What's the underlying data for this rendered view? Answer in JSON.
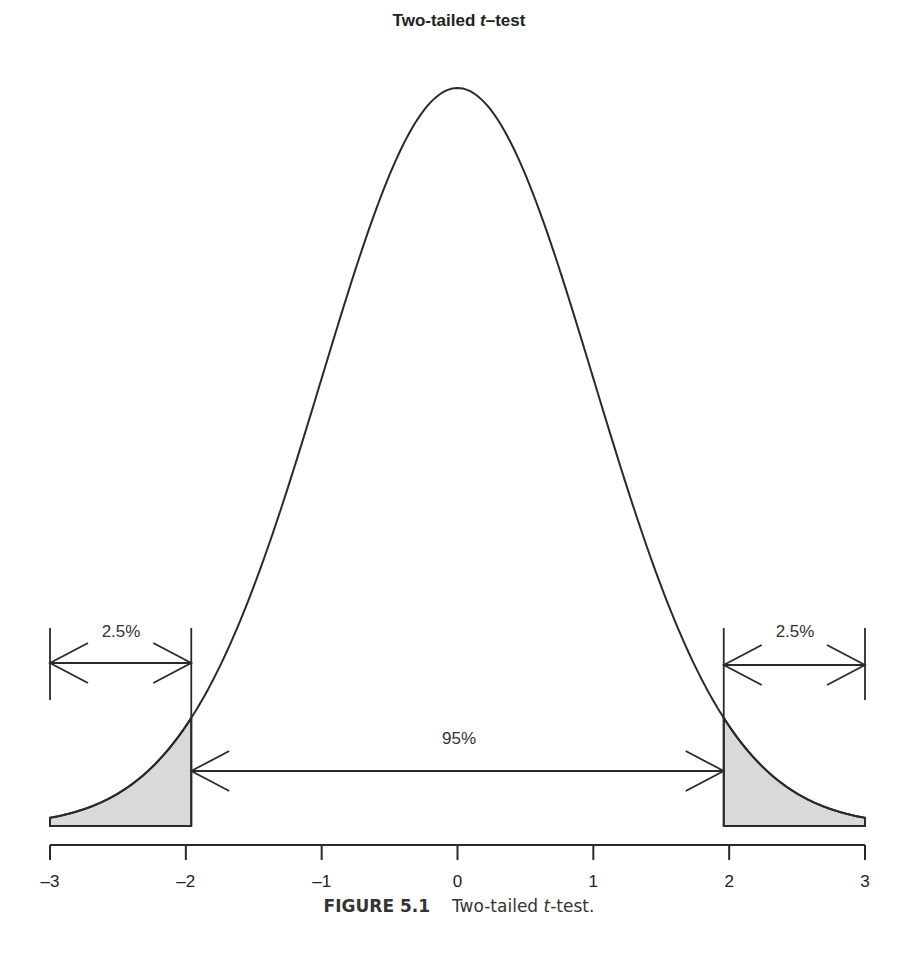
{
  "chart_data": {
    "type": "area",
    "title": "Two-tailed t–test",
    "title_prefix": "Two-tailed ",
    "title_italic": "t",
    "title_suffix": "–test",
    "distribution": "standard normal / t density curve",
    "x_range": [
      -3,
      3
    ],
    "x_ticks": [
      -3,
      -2,
      -1,
      0,
      1,
      2,
      3
    ],
    "x_tick_labels": [
      "–3",
      "–2",
      "–1",
      "0",
      "1",
      "2",
      "3"
    ],
    "critical_values": [
      -1.96,
      1.96
    ],
    "shaded_regions": [
      {
        "from": -3,
        "to": -1.96,
        "label": "2.5%",
        "color": "#d9d9d9"
      },
      {
        "from": 1.96,
        "to": 3,
        "label": "2.5%",
        "color": "#d9d9d9"
      }
    ],
    "annotations": [
      {
        "text": "2.5%",
        "span": [
          -3,
          -1.96
        ],
        "type": "double-arrow"
      },
      {
        "text": "95%",
        "span": [
          -1.96,
          1.96
        ],
        "type": "double-arrow"
      },
      {
        "text": "2.5%",
        "span": [
          1.96,
          3
        ],
        "type": "double-arrow"
      }
    ],
    "xlabel": "",
    "ylabel": "",
    "grid": false
  },
  "labels": {
    "left_tail": "2.5%",
    "right_tail": "2.5%",
    "middle": "95%"
  },
  "caption": {
    "figure": "FIGURE 5.1",
    "text_prefix": "Two-tailed ",
    "text_italic": "t",
    "text_suffix": "-test."
  }
}
